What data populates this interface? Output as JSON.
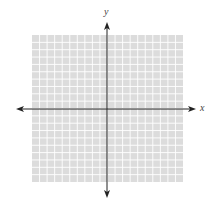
{
  "diagram": {
    "type": "coordinate-plane",
    "x_label": "x",
    "y_label": "y",
    "grid": {
      "cells_x": 20,
      "cells_y": 20,
      "left": 32,
      "top": 35,
      "right": 183,
      "bottom": 182,
      "fill_color": "#dcdcdc",
      "line_color": "#ffffff"
    },
    "axes": {
      "origin_x": 107,
      "origin_y": 109,
      "x_start": 16,
      "x_end": 196,
      "y_start": 22,
      "y_end": 198,
      "color": "#222222"
    }
  }
}
